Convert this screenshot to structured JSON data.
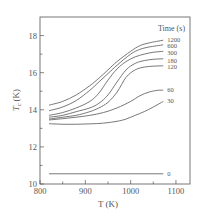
{
  "chart_data": {
    "type": "line",
    "title": "",
    "xlabel": "T (K)",
    "ylabel": "T_c (K)",
    "ylabel_main": "T",
    "ylabel_sub": "c",
    "ylabel_unit": "(K)",
    "xlim": [
      800,
      1131
    ],
    "ylim": [
      10,
      19
    ],
    "x_ticks": [
      800,
      900,
      1000,
      1100
    ],
    "x_tick_labels": [
      "800",
      "900",
      "1000",
      "1100"
    ],
    "x_minor_step": 50,
    "y_ticks": [
      10,
      12,
      14,
      16,
      18
    ],
    "y_tick_labels": [
      "10",
      "12",
      "14",
      "16",
      "18"
    ],
    "y_minor_step": 1,
    "grid": false,
    "legend_title": "Time (s)",
    "legend_placement": "right-end-of-lines",
    "series": [
      {
        "name": "1200",
        "x": [
          820,
          850,
          880,
          910,
          930,
          950,
          970,
          1000,
          1020,
          1040,
          1072
        ],
        "values": [
          14.25,
          14.45,
          14.8,
          15.3,
          15.7,
          16.15,
          16.6,
          17.15,
          17.45,
          17.6,
          17.75
        ]
      },
      {
        "name": "600",
        "x": [
          820,
          850,
          880,
          910,
          930,
          950,
          970,
          1000,
          1020,
          1040,
          1072
        ],
        "values": [
          13.95,
          14.15,
          14.5,
          15.05,
          15.5,
          15.95,
          16.4,
          17.0,
          17.25,
          17.38,
          17.5
        ]
      },
      {
        "name": "300",
        "x": [
          820,
          850,
          880,
          910,
          930,
          950,
          970,
          990,
          1010,
          1030,
          1050,
          1072
        ],
        "values": [
          13.7,
          13.85,
          14.1,
          14.45,
          14.9,
          15.6,
          16.2,
          16.6,
          16.85,
          17.0,
          17.1,
          17.15
        ]
      },
      {
        "name": "180",
        "x": [
          820,
          850,
          880,
          910,
          930,
          950,
          970,
          990,
          1010,
          1030,
          1050,
          1072
        ],
        "values": [
          13.6,
          13.7,
          13.9,
          14.1,
          14.35,
          14.8,
          15.5,
          16.15,
          16.5,
          16.65,
          16.72,
          16.75
        ]
      },
      {
        "name": "120",
        "x": [
          820,
          850,
          880,
          910,
          930,
          950,
          970,
          990,
          1010,
          1030,
          1050,
          1072
        ],
        "values": [
          13.5,
          13.6,
          13.7,
          13.9,
          14.1,
          14.4,
          14.95,
          15.75,
          16.15,
          16.3,
          16.35,
          16.37
        ]
      },
      {
        "name": "60",
        "x": [
          820,
          850,
          880,
          910,
          940,
          970,
          1000,
          1020,
          1040,
          1060,
          1072
        ],
        "values": [
          13.45,
          13.52,
          13.6,
          13.7,
          13.85,
          14.1,
          14.45,
          14.75,
          14.95,
          15.05,
          15.05
        ]
      },
      {
        "name": "30",
        "x": [
          820,
          850,
          880,
          910,
          940,
          970,
          990,
          1010,
          1030,
          1050,
          1072
        ],
        "values": [
          13.25,
          13.22,
          13.22,
          13.24,
          13.28,
          13.38,
          13.5,
          13.7,
          13.9,
          14.15,
          14.45
        ]
      },
      {
        "name": "0",
        "x": [
          820,
          1072
        ],
        "values": [
          10.55,
          10.55
        ]
      }
    ],
    "line_color": "#555555"
  }
}
